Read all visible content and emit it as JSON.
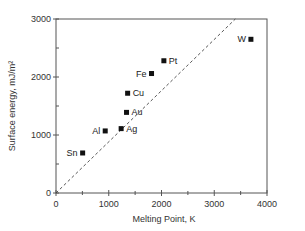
{
  "chart_data": {
    "type": "scatter",
    "title": "",
    "xlabel": "Melting Point, K",
    "ylabel": "Surface energy, mJ/m²",
    "xlim": [
      0,
      4000
    ],
    "ylim": [
      0,
      3000
    ],
    "xticks": [
      0,
      1000,
      2000,
      3000,
      4000
    ],
    "xminor": [
      500,
      1500,
      2500,
      3500
    ],
    "yticks": [
      0,
      1000,
      2000,
      3000
    ],
    "yminor": [
      500,
      1500,
      2500
    ],
    "grid": false,
    "legend": null,
    "points": [
      {
        "label": "Sn",
        "x": 505,
        "y": 690,
        "label_side": "left"
      },
      {
        "label": "Al",
        "x": 933,
        "y": 1070,
        "label_side": "left"
      },
      {
        "label": "Ag",
        "x": 1235,
        "y": 1110,
        "label_side": "right"
      },
      {
        "label": "Au",
        "x": 1337,
        "y": 1390,
        "label_side": "right"
      },
      {
        "label": "Cu",
        "x": 1358,
        "y": 1720,
        "label_side": "right"
      },
      {
        "label": "Fe",
        "x": 1811,
        "y": 2060,
        "label_side": "left"
      },
      {
        "label": "Pt",
        "x": 2045,
        "y": 2280,
        "label_side": "right"
      },
      {
        "label": "W",
        "x": 3695,
        "y": 2650,
        "label_side": "left"
      }
    ],
    "trend_line": {
      "style": "dashed",
      "from": [
        0,
        0
      ],
      "to": [
        3400,
        3000
      ]
    }
  },
  "axes": {
    "x_title": "Melting Point, K",
    "y_title": "Surface energy, mJ/m²",
    "x_tick_labels": [
      "0",
      "1000",
      "2000",
      "3000",
      "4000"
    ],
    "y_tick_labels": [
      "0",
      "1000",
      "2000",
      "3000"
    ]
  },
  "colors": {
    "axis": "#555555",
    "marker": "#111111",
    "trend": "#444444"
  }
}
